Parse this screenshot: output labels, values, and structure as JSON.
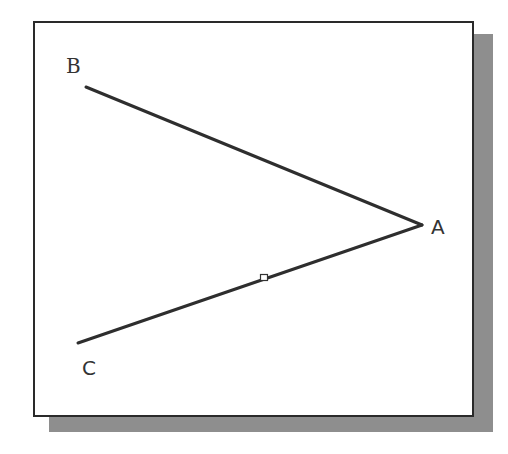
{
  "diagram": {
    "type": "angle",
    "points": {
      "A": {
        "label": "A",
        "x": 422,
        "y": 225
      },
      "B": {
        "label": "B",
        "x": 86,
        "y": 87
      },
      "C": {
        "label": "C",
        "x": 78,
        "y": 343
      }
    },
    "segments": [
      {
        "from": "A",
        "to": "B"
      },
      {
        "from": "A",
        "to": "C"
      }
    ],
    "marker": {
      "shape": "square",
      "x": 264,
      "y": 278,
      "on_segment": "AC"
    },
    "colors": {
      "line": "#2e2e2e",
      "frame": "#2a2a2a",
      "shadow": "#8e8e8e",
      "background": "#ffffff"
    }
  }
}
